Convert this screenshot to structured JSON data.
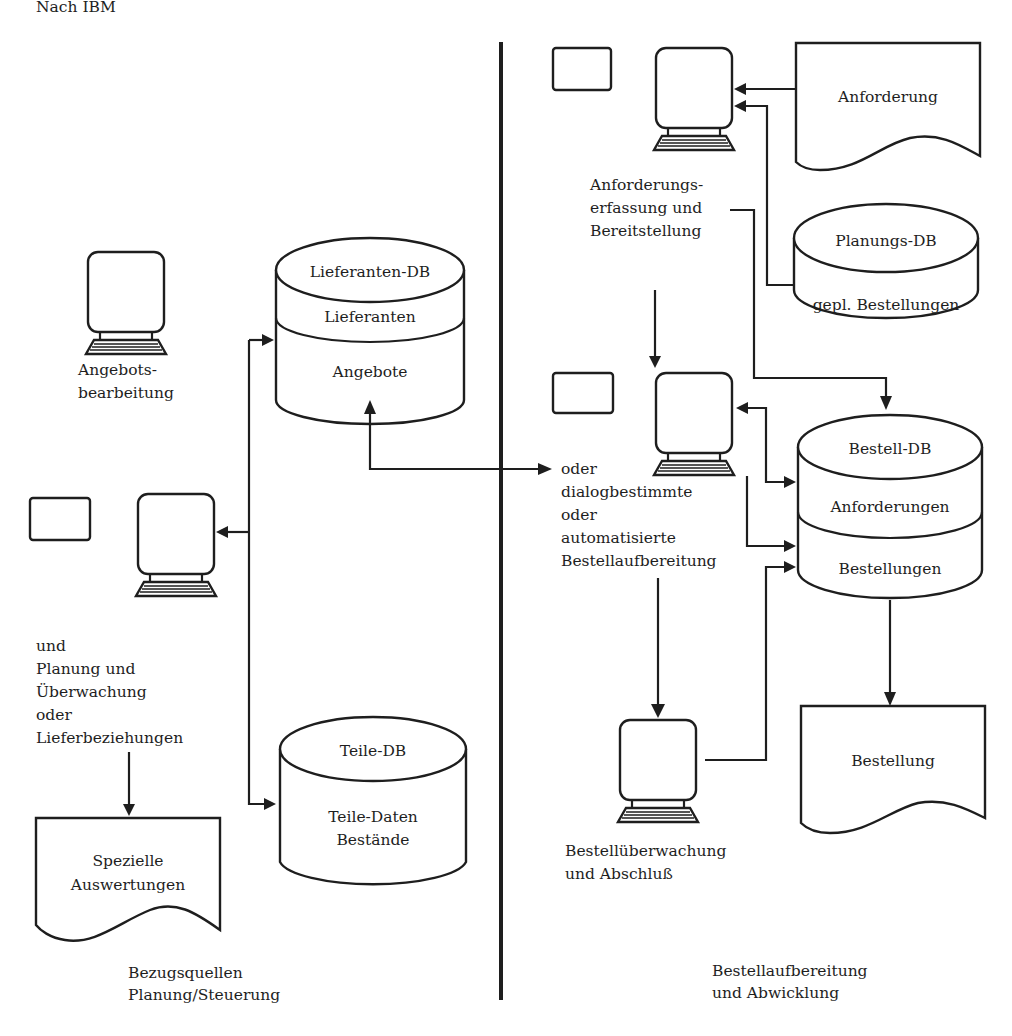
{
  "source_note": "Nach IBM",
  "sections": {
    "left": {
      "line1": "Bezugsquellen",
      "line2": "Planung/Steuerung"
    },
    "right": {
      "line1": "Bestellaufbereitung",
      "line2": "und Abwicklung"
    }
  },
  "terminals": {
    "angebot": {
      "line1": "Angebots-",
      "line2": "bearbeitung"
    },
    "planung": {
      "lines": [
        "und",
        "Planung und",
        "Überwachung",
        "oder",
        "Lieferbeziehungen"
      ]
    },
    "anforderung": {
      "line1": "Anforderungs-",
      "line2": "erfassung und",
      "line3": "Bereitstellung"
    },
    "bestellaufbereitung": {
      "lines": [
        "oder",
        "dialogbestimmte",
        "oder",
        "automatisierte",
        "Bestellaufbereitung"
      ]
    },
    "ueberwachung": {
      "line1": "Bestellüberwachung",
      "line2": "und Abschluß"
    }
  },
  "databases": {
    "lieferanten": {
      "title": "Lieferanten-DB",
      "seg1": "Lieferanten",
      "seg2": "Angebote"
    },
    "teile": {
      "title": "Teile-DB",
      "line1": "Teile-Daten",
      "line2": "Bestände"
    },
    "planung": {
      "title": "Planungs-DB",
      "seg1": "gepl. Bestellungen"
    },
    "bestell": {
      "title": "Bestell-DB",
      "seg1": "Anforderungen",
      "seg2": "Bestellungen"
    }
  },
  "documents": {
    "anforderung": {
      "label": "Anforderung"
    },
    "bestellung": {
      "label": "Bestellung"
    },
    "auswertungen": {
      "line1": "Spezielle",
      "line2": "Auswertungen"
    }
  },
  "colors": {
    "ink": "#1e1e1e",
    "paper": "#ffffff"
  }
}
